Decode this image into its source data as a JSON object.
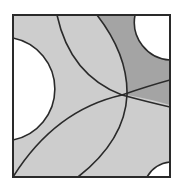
{
  "diagram": {
    "title": "",
    "square": {
      "x": 13,
      "y": 15,
      "width": 157,
      "height": 162
    },
    "colors": {
      "background": "#ffffff",
      "light_fill": "#cdcdcd",
      "dark_fill": "#a4a4a4",
      "white_region": "#ffffff",
      "stroke": "#2a2a2a"
    },
    "regions": [
      {
        "name": "left-white-disc",
        "fill": "white"
      },
      {
        "name": "top-right-white-disc",
        "fill": "white"
      },
      {
        "name": "bottom-right-white-disc",
        "fill": "white"
      },
      {
        "name": "top-right-dark-region",
        "fill": "dark"
      },
      {
        "name": "remaining-light-region",
        "fill": "light"
      }
    ],
    "arcs": [
      {
        "name": "left-circle-arc",
        "from": [
          13,
          38
        ],
        "to": [
          13,
          140
        ]
      },
      {
        "name": "top-right-circle-arc",
        "from": [
          135,
          15
        ],
        "to": [
          170,
          60
        ]
      },
      {
        "name": "bottom-right-circle-arc",
        "from": [
          147,
          177
        ],
        "to": [
          170,
          162
        ]
      },
      {
        "name": "arc-top-to-right",
        "from": [
          57,
          15
        ],
        "via": [
          122,
          95
        ],
        "to": [
          170,
          105
        ]
      },
      {
        "name": "arc-top-to-bottom",
        "from": [
          97,
          15
        ],
        "via": [
          127,
          95
        ],
        "to": [
          78,
          177
        ]
      },
      {
        "name": "arc-corner-to-right",
        "from": [
          13,
          177
        ],
        "via": [
          122,
          95
        ],
        "to": [
          170,
          80
        ]
      }
    ]
  }
}
